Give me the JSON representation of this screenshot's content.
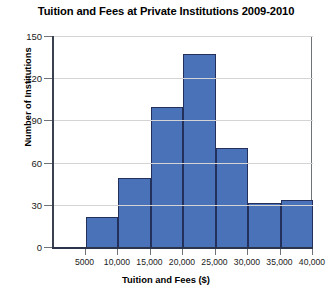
{
  "chart_data": {
    "type": "bar",
    "title": "Tuition and Fees at Private Institutions 2009-2010",
    "xlabel": "Tuition and Fees ($)",
    "ylabel": "Number of Institutions",
    "grid": true,
    "legend": "none",
    "bin_width": 5000,
    "xlim": [
      0,
      40000
    ],
    "ylim": [
      0,
      150
    ],
    "xticks": [
      5000,
      10000,
      15000,
      20000,
      25000,
      30000,
      35000,
      40000
    ],
    "xticklabels": [
      "5000",
      "10,000",
      "15,000",
      "20,000",
      "25,000",
      "30,000",
      "35,000",
      "40,000"
    ],
    "yticks": [
      0,
      30,
      60,
      90,
      120,
      150
    ],
    "yticklabels": [
      "0",
      "30",
      "60",
      "90",
      "120",
      "150"
    ],
    "categories": [
      "5000-10,000",
      "10,000-15,000",
      "15,000-20,000",
      "20,000-25,000",
      "25,000-30,000",
      "30,000-35,000",
      "35,000-40,000"
    ],
    "bin_starts": [
      5000,
      10000,
      15000,
      20000,
      25000,
      30000,
      35000
    ],
    "values": [
      22,
      50,
      100,
      138,
      71,
      32,
      34
    ],
    "bar_color": "#4a72b8",
    "bar_edge_color": "#23305c",
    "grid_color": "#d4d4d4",
    "axis_color": "#2b3448",
    "background": "#ffffff"
  }
}
